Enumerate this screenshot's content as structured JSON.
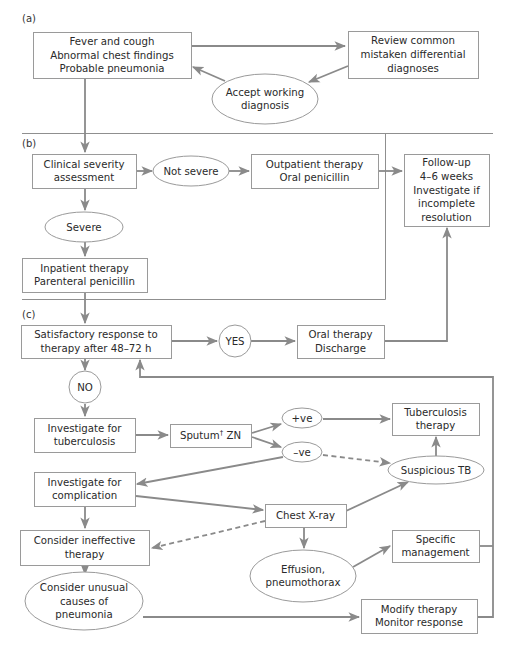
{
  "panels": {
    "a": "(a)",
    "b": "(b)",
    "c": "(c)"
  },
  "colors": {
    "line": "#8a8a8a",
    "border": "#9a9a9a",
    "text": "#2a2a2a"
  },
  "nodes": {
    "fever": {
      "shape": "box",
      "lines": [
        "Fever and cough",
        "Abnormal chest findings",
        "Probable pneumonia"
      ]
    },
    "review": {
      "shape": "box",
      "lines": [
        "Review common",
        "mistaken differential",
        "diagnoses"
      ]
    },
    "accept": {
      "shape": "ellipse",
      "lines": [
        "Accept working",
        "diagnosis"
      ]
    },
    "clinical": {
      "shape": "box",
      "lines": [
        "Clinical severity",
        "assessment"
      ]
    },
    "notsevere": {
      "shape": "ellipse",
      "lines": [
        "Not severe"
      ]
    },
    "outpatient": {
      "shape": "box",
      "lines": [
        "Outpatient therapy",
        "Oral penicillin"
      ]
    },
    "followup": {
      "shape": "box",
      "lines": [
        "Follow-up",
        "4–6 weeks",
        "Investigate if",
        "incomplete",
        "resolution"
      ]
    },
    "severe": {
      "shape": "ellipse",
      "lines": [
        "Severe"
      ]
    },
    "inpatient": {
      "shape": "box",
      "lines": [
        "Inpatient therapy",
        "Parenteral penicillin"
      ]
    },
    "satisfactory": {
      "shape": "box",
      "lines": [
        "Satisfactory response to",
        "therapy after 48–72 h"
      ]
    },
    "yes": {
      "shape": "circle",
      "lines": [
        "YES"
      ]
    },
    "oral": {
      "shape": "box",
      "lines": [
        "Oral therapy",
        "Discharge"
      ]
    },
    "no": {
      "shape": "circle",
      "lines": [
        "NO"
      ]
    },
    "invtb": {
      "shape": "box",
      "lines": [
        "Investigate for",
        "tuberculosis"
      ]
    },
    "sputum": {
      "shape": "box",
      "lines": [
        "Sputum† ZN"
      ]
    },
    "pos": {
      "shape": "ellipse",
      "lines": [
        "+ve"
      ]
    },
    "neg": {
      "shape": "ellipse",
      "lines": [
        "–ve"
      ]
    },
    "tbtherapy": {
      "shape": "box",
      "lines": [
        "Tuberculosis",
        "therapy"
      ]
    },
    "susptb": {
      "shape": "ellipse",
      "lines": [
        "Suspicious TB"
      ]
    },
    "invcomp": {
      "shape": "box",
      "lines": [
        "Investigate for",
        "complication"
      ]
    },
    "cxr": {
      "shape": "box",
      "lines": [
        "Chest X-ray"
      ]
    },
    "ineffective": {
      "shape": "box",
      "lines": [
        "Consider ineffective",
        "therapy"
      ]
    },
    "effusion": {
      "shape": "ellipse",
      "lines": [
        "Effusion,",
        "pneumothorax"
      ]
    },
    "specific": {
      "shape": "box",
      "lines": [
        "Specific",
        "management"
      ]
    },
    "unusual": {
      "shape": "ellipse",
      "lines": [
        "Consider unusual",
        "causes of",
        "pneumonia"
      ]
    },
    "modify": {
      "shape": "box",
      "lines": [
        "Modify therapy",
        "Monitor response"
      ]
    }
  },
  "edges": [
    {
      "from": "fever",
      "to": "review",
      "style": "solid"
    },
    {
      "from": "review",
      "to": "accept",
      "style": "solid"
    },
    {
      "from": "accept",
      "to": "fever",
      "style": "solid"
    },
    {
      "from": "fever",
      "to": "clinical",
      "style": "solid"
    },
    {
      "from": "clinical",
      "to": "notsevere",
      "style": "solid"
    },
    {
      "from": "notsevere",
      "to": "outpatient",
      "style": "solid"
    },
    {
      "from": "outpatient",
      "to": "followup",
      "style": "solid"
    },
    {
      "from": "clinical",
      "to": "severe",
      "style": "solid"
    },
    {
      "from": "severe",
      "to": "inpatient",
      "style": "solid"
    },
    {
      "from": "inpatient",
      "to": "satisfactory",
      "style": "solid"
    },
    {
      "from": "satisfactory",
      "to": "yes",
      "style": "solid"
    },
    {
      "from": "yes",
      "to": "oral",
      "style": "solid"
    },
    {
      "from": "oral",
      "to": "followup",
      "style": "solid"
    },
    {
      "from": "satisfactory",
      "to": "no",
      "style": "solid"
    },
    {
      "from": "no",
      "to": "invtb",
      "style": "solid"
    },
    {
      "from": "invtb",
      "to": "sputum",
      "style": "solid"
    },
    {
      "from": "sputum",
      "to": "pos",
      "style": "solid"
    },
    {
      "from": "sputum",
      "to": "neg",
      "style": "solid"
    },
    {
      "from": "pos",
      "to": "tbtherapy",
      "style": "solid"
    },
    {
      "from": "neg",
      "to": "susptb",
      "style": "dashed"
    },
    {
      "from": "neg",
      "to": "invcomp",
      "style": "solid"
    },
    {
      "from": "susptb",
      "to": "tbtherapy",
      "style": "solid"
    },
    {
      "from": "invcomp",
      "to": "cxr",
      "style": "solid"
    },
    {
      "from": "invcomp",
      "to": "ineffective",
      "style": "solid"
    },
    {
      "from": "cxr",
      "to": "susptb",
      "style": "solid"
    },
    {
      "from": "cxr",
      "to": "ineffective",
      "style": "dashed"
    },
    {
      "from": "cxr",
      "to": "effusion",
      "style": "solid"
    },
    {
      "from": "effusion",
      "to": "specific",
      "style": "solid"
    },
    {
      "from": "ineffective",
      "to": "unusual",
      "style": "solid"
    },
    {
      "from": "unusual",
      "to": "modify",
      "style": "solid"
    },
    {
      "from": "specific",
      "to": "satisfactory",
      "style": "solid"
    },
    {
      "from": "modify",
      "to": "satisfactory",
      "style": "solid"
    }
  ]
}
